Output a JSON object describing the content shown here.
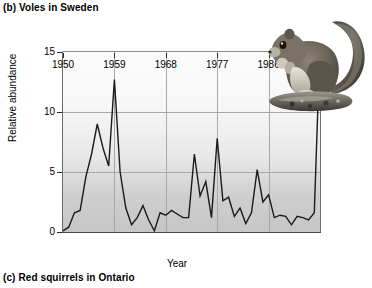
{
  "panel": {
    "title": "(b) Voles in Sweden",
    "next_caption": "(c) Red squirrels in Ontario"
  },
  "photo": {
    "name": "squirrel-photo",
    "alt": "red squirrel perched on a rock"
  },
  "chart_data": {
    "type": "line",
    "title": "(b) Voles in Sweden",
    "xlabel": "Year",
    "ylabel": "Relative abundance",
    "xlim": [
      1950,
      1995
    ],
    "ylim": [
      0,
      15
    ],
    "grid": true,
    "legend": "none",
    "xticks": [
      1950,
      1959,
      1968,
      1977,
      1986,
      1995
    ],
    "xtick_labels": [
      "1950",
      "1959",
      "1968",
      "1977",
      "1986",
      "1995"
    ],
    "yticks": [
      0,
      5,
      10,
      15
    ],
    "ytick_labels": [
      "0",
      "5",
      "10",
      "15"
    ],
    "line_color": "#1a1a1a",
    "x": [
      1950,
      1951,
      1952,
      1953,
      1954,
      1955,
      1956,
      1957,
      1958,
      1959,
      1960,
      1961,
      1962,
      1963,
      1964,
      1965,
      1966,
      1967,
      1968,
      1969,
      1970,
      1971,
      1972,
      1973,
      1974,
      1975,
      1976,
      1977,
      1978,
      1979,
      1980,
      1981,
      1982,
      1983,
      1984,
      1985,
      1986,
      1987,
      1988,
      1989,
      1990,
      1991,
      1992,
      1993,
      1994,
      1995
    ],
    "values": [
      0.1,
      0.4,
      1.6,
      1.8,
      4.6,
      6.5,
      9.0,
      7.0,
      5.5,
      12.7,
      5.0,
      2.0,
      0.6,
      1.2,
      2.2,
      1.0,
      0.1,
      1.6,
      1.4,
      1.8,
      1.5,
      1.2,
      1.2,
      6.5,
      3.0,
      4.2,
      1.2,
      7.8,
      2.6,
      2.9,
      1.3,
      2.0,
      0.7,
      1.6,
      5.2,
      2.5,
      3.1,
      1.2,
      1.4,
      1.3,
      0.6,
      1.3,
      1.2,
      1.0,
      1.6,
      15.6
    ],
    "annotations": [
      "final 1995 value rises off the top of the plotted range"
    ]
  }
}
